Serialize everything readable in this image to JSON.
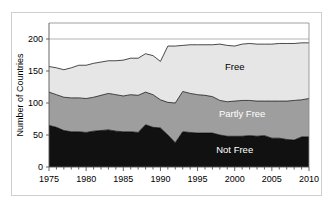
{
  "chart_data": {
    "type": "area",
    "title": "",
    "xlabel": "",
    "ylabel": "Number of Countries",
    "stacked": true,
    "grid": true,
    "legend_position": "inline-annotations",
    "xlim": [
      1975,
      2010
    ],
    "ylim": [
      0,
      225
    ],
    "yticks": [
      0,
      50,
      100,
      150,
      200
    ],
    "ytick_labels": [
      "0",
      "50",
      "100",
      "150",
      "200"
    ],
    "xticks": [
      1975,
      1980,
      1985,
      1990,
      1995,
      2000,
      2005,
      2010
    ],
    "xtick_labels": [
      "1975",
      "1980",
      "1985",
      "1990",
      "1995",
      "2000",
      "2005",
      "2010"
    ],
    "x": [
      1975,
      1976,
      1977,
      1978,
      1979,
      1980,
      1981,
      1982,
      1983,
      1984,
      1985,
      1986,
      1987,
      1988,
      1989,
      1990,
      1991,
      1992,
      1993,
      1994,
      1995,
      1996,
      1997,
      1998,
      1999,
      2000,
      2001,
      2002,
      2003,
      2004,
      2005,
      2006,
      2007,
      2008,
      2009,
      2010
    ],
    "series": [
      {
        "name": "Not Free",
        "color": "#111111",
        "values": [
          65,
          62,
          57,
          55,
          55,
          54,
          56,
          57,
          58,
          56,
          55,
          55,
          54,
          66,
          62,
          61,
          50,
          38,
          55,
          54,
          53,
          53,
          53,
          50,
          48,
          48,
          48,
          49,
          48,
          49,
          45,
          45,
          43,
          42,
          47,
          47
        ]
      },
      {
        "name": "Partly Free",
        "color": "#9e9e9e",
        "values": [
          52,
          51,
          52,
          53,
          53,
          53,
          53,
          55,
          57,
          57,
          56,
          58,
          58,
          51,
          51,
          44,
          51,
          62,
          63,
          61,
          60,
          59,
          57,
          54,
          54,
          55,
          56,
          55,
          55,
          54,
          58,
          58,
          60,
          62,
          58,
          60
        ]
      },
      {
        "name": "Free",
        "color": "#e6e6e6",
        "values": [
          40,
          42,
          43,
          47,
          51,
          52,
          53,
          52,
          51,
          53,
          56,
          57,
          58,
          60,
          61,
          60,
          88,
          89,
          72,
          76,
          78,
          79,
          81,
          88,
          88,
          86,
          88,
          89,
          89,
          89,
          89,
          90,
          90,
          89,
          89,
          87
        ]
      }
    ],
    "totals": [
      157,
      155,
      152,
      155,
      159,
      159,
      162,
      164,
      166,
      166,
      167,
      170,
      170,
      177,
      174,
      165,
      189,
      189,
      190,
      191,
      191,
      191,
      191,
      192,
      190,
      189,
      192,
      193,
      192,
      192,
      192,
      193,
      193,
      193,
      194,
      194
    ],
    "annotations": [
      {
        "text": "Free",
        "x": 2000,
        "y": 152,
        "style": "dark"
      },
      {
        "text": "Partly Free",
        "x": 2001,
        "y": 78,
        "style": "light"
      },
      {
        "text": "Not Free",
        "x": 2000,
        "y": 22,
        "style": "light"
      }
    ]
  }
}
